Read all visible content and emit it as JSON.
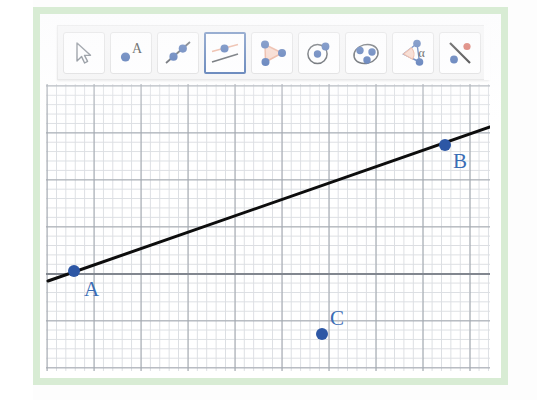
{
  "app": {
    "name": "GeoGebra Geometry",
    "canvas_label": "graphics-view"
  },
  "toolbar": {
    "selected_index": 3,
    "tools": [
      {
        "id": "move",
        "label": "Move",
        "icon": "cursor-arrow-icon",
        "selected": false
      },
      {
        "id": "point",
        "label": "Point",
        "icon": "point-a-icon",
        "selected": false
      },
      {
        "id": "line",
        "label": "Line",
        "icon": "line-through-points-icon",
        "selected": false
      },
      {
        "id": "parallel-line",
        "label": "Parallel Line",
        "icon": "parallel-line-icon",
        "selected": true
      },
      {
        "id": "polygon",
        "label": "Polygon",
        "icon": "triangle-polygon-icon",
        "selected": false
      },
      {
        "id": "circle",
        "label": "Circle with Center",
        "icon": "circle-center-point-icon",
        "selected": false
      },
      {
        "id": "ellipse",
        "label": "Ellipse",
        "icon": "ellipse-three-points-icon",
        "selected": false
      },
      {
        "id": "angle",
        "label": "Angle",
        "icon": "angle-alpha-icon",
        "selected": false
      },
      {
        "id": "reflect",
        "label": "Reflect about Line",
        "icon": "reflect-about-line-icon",
        "selected": false
      },
      {
        "id": "more",
        "label": "More Tools",
        "icon": "more-tools-icon",
        "selected": false
      }
    ],
    "angle_icon_glyph": "α",
    "point_icon_glyph": "A"
  },
  "canvas": {
    "grid": {
      "minor_spacing_px": 9.4,
      "major_spacing_px": 47,
      "minor_color": "#d6d9de",
      "major_color": "#9aa0a8",
      "axis_color": "#7d838b",
      "show_grid": true
    },
    "line": {
      "id": "line-ab",
      "color": "#0d0d0d",
      "width_px": 3,
      "x1": 2,
      "y1": 197,
      "x2": 444,
      "y2": 43
    },
    "points": [
      {
        "name": "A",
        "label": "A",
        "x": 28,
        "y": 187,
        "label_dx": 10,
        "label_dy": 8,
        "color": "#2d57a5"
      },
      {
        "name": "B",
        "label": "B",
        "x": 399,
        "y": 61,
        "label_dx": 8,
        "label_dy": 6,
        "color": "#2d57a5"
      },
      {
        "name": "C",
        "label": "C",
        "x": 276,
        "y": 250,
        "label_dx": 8,
        "label_dy": -26,
        "color": "#2d57a5"
      }
    ],
    "point_radius_px": 6,
    "label_color": "#3a6db5"
  },
  "colors": {
    "frame_green": "#d8ecd4",
    "point_blue": "#2d57a5",
    "label_blue": "#3a6db5",
    "selected_border": "#3a64a8",
    "icon_accent_salmon": "#e8a084",
    "icon_fill_salmon": "#f7cfbf",
    "line_black": "#0d0d0d",
    "toolbar_bg": "#f4f4f4",
    "button_bg": "#ffffff"
  }
}
